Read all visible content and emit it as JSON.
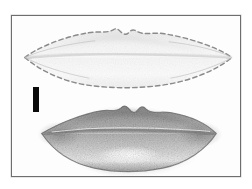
{
  "figure": {
    "caption": "",
    "background_color": "#ffffff",
    "panel": {
      "border_color": "#6e6e6e",
      "fill_color": "#fdfdfd",
      "x": 11,
      "y": 15,
      "width": 230,
      "height": 162
    },
    "scale_bar": {
      "label": "",
      "color": "#0a0a0a",
      "x": 32,
      "y": 86,
      "width": 6,
      "height": 25,
      "orientation": "vertical"
    },
    "objects": [
      {
        "name": "upper-lips-outline",
        "title": "pale lips with dashed contour",
        "style": "faint shading, dashed outline",
        "outline_color": "#8c8c8c",
        "fill_color": "#f7f7f7",
        "dashed": true,
        "left_corner_x": 24,
        "right_corner_x": 233,
        "center_seam_y": 57,
        "cupid_peak_left_x": 113,
        "cupid_peak_right_x": 140,
        "cupid_dip_x": 127,
        "top_y": 28,
        "bottom_y": 86
      },
      {
        "name": "lower-lips-shaded",
        "title": "gray shaded lips",
        "style": "grainy stipple shading with highlight",
        "outline_color": "#707070",
        "fill_color": "#9a9a9a",
        "highlight_color": "#fbfbfb",
        "dashed": false,
        "left_corner_x": 41,
        "right_corner_x": 217,
        "center_seam_y": 134,
        "cupid_peak_left_x": 113,
        "cupid_peak_right_x": 142,
        "cupid_dip_x": 128,
        "top_y": 105,
        "bottom_y": 170
      }
    ]
  }
}
